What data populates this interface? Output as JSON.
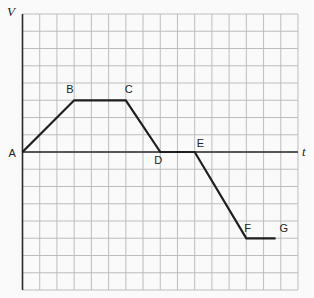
{
  "chart_data": {
    "type": "line",
    "title": "",
    "xlabel": "t",
    "ylabel": "V",
    "grid": true,
    "grid_cols": 16,
    "grid_rows": 16,
    "axis_row_from_top": 8,
    "xlim": [
      0,
      16
    ],
    "ylim": [
      -8,
      8
    ],
    "points": [
      {
        "label": "A",
        "t": 0,
        "v": 0
      },
      {
        "label": "B",
        "t": 3,
        "v": 3
      },
      {
        "label": "C",
        "t": 6,
        "v": 3
      },
      {
        "label": "D",
        "t": 8,
        "v": 0
      },
      {
        "label": "E",
        "t": 10,
        "v": 0
      },
      {
        "label": "F",
        "t": 13,
        "v": -5
      },
      {
        "label": "G",
        "t": 14.7,
        "v": -5
      }
    ],
    "colors": {
      "grid": "#bdbdbd",
      "line": "#1e1e1e",
      "axis": "#2a2a2a"
    }
  }
}
